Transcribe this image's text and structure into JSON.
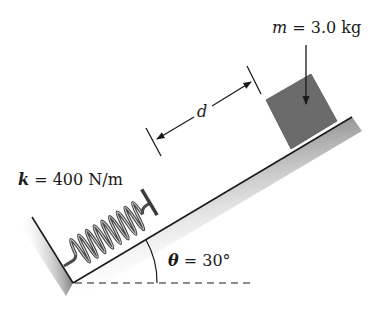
{
  "diagram": {
    "colors": {
      "ground": "#555555",
      "block": "#6b6b6b",
      "spring": "#4a4a4a",
      "line": "#1a1a1a",
      "text": "#1a1a1a"
    },
    "labels": {
      "mass": {
        "symbol": "m",
        "equals": " = 3.0 kg"
      },
      "spring_constant": {
        "symbol": "k",
        "equals": " = 400 N/m"
      },
      "distance": {
        "symbol": "d"
      },
      "angle": {
        "symbol": "θ",
        "equals": " = 30°"
      }
    }
  }
}
